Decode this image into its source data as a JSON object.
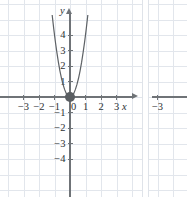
{
  "figure": {
    "type": "cartesian-graph-pair",
    "background_color": "#ffffff",
    "axis_color": "#6f7377",
    "grid_color": "#e2e6ec",
    "curve_color": "#5d6165",
    "point_color": "#5a5e62"
  },
  "chart_data": {
    "type": "line",
    "title": "",
    "subtitle": "",
    "xlabel": "x",
    "ylabel": "y",
    "xlim": [
      -3.9,
      4.3
    ],
    "ylim": [
      -4.9,
      4.9
    ],
    "grid": true,
    "legend": null,
    "equation": "y = 4x^2",
    "series": [
      {
        "name": "y = 4x^2",
        "color": "#5d6165",
        "x": [
          -1.15,
          -1.05,
          -0.95,
          -0.85,
          -0.75,
          -0.65,
          -0.55,
          -0.45,
          -0.35,
          -0.25,
          -0.15,
          -0.05,
          0,
          0.05,
          0.15,
          0.25,
          0.35,
          0.45,
          0.55,
          0.65,
          0.75,
          0.85,
          0.95,
          1.05,
          1.15
        ],
        "y": [
          5.29,
          4.41,
          3.61,
          2.89,
          2.25,
          1.69,
          1.21,
          0.81,
          0.49,
          0.25,
          0.09,
          0.01,
          0,
          0.01,
          0.09,
          0.25,
          0.49,
          0.81,
          1.21,
          1.69,
          2.25,
          2.89,
          3.61,
          4.41,
          5.29
        ]
      }
    ],
    "points": [
      {
        "label": "origin",
        "x": 0,
        "y": 0,
        "filled": true
      }
    ],
    "x_ticks": [
      {
        "value": -3,
        "label": "−3"
      },
      {
        "value": -2,
        "label": "−2"
      },
      {
        "value": -1,
        "label": "−1"
      },
      {
        "value": 0,
        "label": "0"
      },
      {
        "value": 1,
        "label": "1"
      },
      {
        "value": 2,
        "label": "2"
      },
      {
        "value": 3,
        "label": "3"
      }
    ],
    "y_ticks": [
      {
        "value": 4,
        "label": "4"
      },
      {
        "value": 3,
        "label": "3"
      },
      {
        "value": 2,
        "label": "2"
      },
      {
        "value": 1,
        "label": "1"
      },
      {
        "value": -1,
        "label": "−1"
      },
      {
        "value": -2,
        "label": "−2"
      },
      {
        "value": -3,
        "label": "−3"
      },
      {
        "value": -4,
        "label": "−4"
      }
    ]
  },
  "next_panel": {
    "type": "cartesian-graph",
    "clipped": true,
    "x_ticks": [
      {
        "value": -3,
        "label": "−3"
      }
    ]
  }
}
